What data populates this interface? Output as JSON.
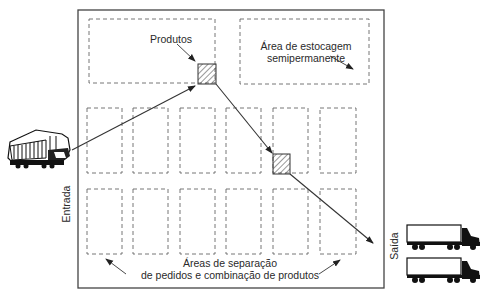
{
  "diagram": {
    "labels": {
      "products": "Produtos",
      "storage_line1": "Área de estocagem",
      "storage_line2": "semipermanente",
      "entry": "Entrada",
      "exit": "Saída",
      "picking_line1": "Áreas de separação",
      "picking_line2": "de pedidos e combinação de produtos"
    },
    "icons": {
      "entry_vehicle": "train-locomotive-icon",
      "exit_vehicles": [
        "truck-icon",
        "truck-icon"
      ],
      "product_marker": "hatched-square"
    },
    "zones": {
      "top_left": "product-storage-area",
      "top_right": "semi-permanent-storage-area",
      "picking_rows": 2,
      "picking_columns": 6
    },
    "colors": {
      "line": "#333333",
      "dashed": "#666666",
      "background": "#ffffff"
    }
  }
}
